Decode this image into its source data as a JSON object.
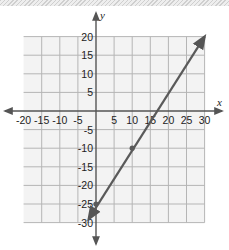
{
  "chart_data": {
    "type": "line",
    "title": "",
    "xlabel": "x",
    "ylabel": "y",
    "xlim": [
      -20,
      30
    ],
    "ylim": [
      -30,
      20
    ],
    "grid": true,
    "x_ticks": [
      -20,
      -15,
      -10,
      -5,
      5,
      10,
      15,
      20,
      25,
      30
    ],
    "y_ticks": [
      20,
      15,
      10,
      5,
      -5,
      -10,
      -15,
      -20,
      -25,
      -30
    ],
    "x_tick_labels": [
      "-20",
      "-15",
      "-10",
      "-5",
      "5",
      "10",
      "15",
      "20",
      "25",
      "30"
    ],
    "y_tick_labels": [
      "20",
      "15",
      "10",
      "5",
      "-5",
      "-10",
      "-15",
      "-20",
      "-25",
      "-30"
    ],
    "series": [
      {
        "name": "line",
        "equation": "y = 1.5x - 25",
        "points": [
          {
            "x": 0,
            "y": -25
          },
          {
            "x": 10,
            "y": -10
          }
        ],
        "line_start": {
          "x": -2,
          "y": -29
        },
        "line_end": {
          "x": 30,
          "y": 20
        },
        "arrows_both_ends": true,
        "color": "#5a5a5a"
      }
    ],
    "legend": null
  },
  "colors": {
    "grid": "#b5b5b5",
    "grid_bg": "#f3f3f3",
    "axis": "#555555",
    "line": "#5a5a5a"
  }
}
